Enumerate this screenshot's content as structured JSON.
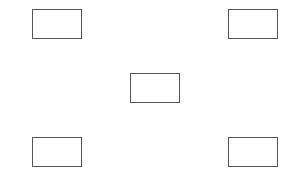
{
  "diagram": {
    "stroke_color": "#555555",
    "background_color": "#ffffff",
    "boxes": [
      {
        "id": "top-left",
        "label": "",
        "x": 32,
        "y": 9,
        "w": 50,
        "h": 30
      },
      {
        "id": "top-right",
        "label": "",
        "x": 228,
        "y": 9,
        "w": 50,
        "h": 30
      },
      {
        "id": "center",
        "label": "",
        "x": 130,
        "y": 73,
        "w": 50,
        "h": 30
      },
      {
        "id": "bottom-left",
        "label": "",
        "x": 32,
        "y": 137,
        "w": 50,
        "h": 30
      },
      {
        "id": "bottom-right",
        "label": "",
        "x": 228,
        "y": 137,
        "w": 50,
        "h": 30
      }
    ]
  }
}
